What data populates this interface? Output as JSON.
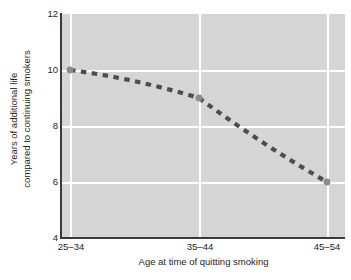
{
  "chart_data": {
    "type": "line",
    "title": "",
    "subtitle": "",
    "xlabel": "Age at time of quitting smoking",
    "ylabel": "Years of additional life compared to continuing smokers",
    "ylabel_line1": "Years of additional life",
    "ylabel_line2": "compared to continuing smokers",
    "categories": [
      "25–34",
      "35–44",
      "45–54"
    ],
    "values": [
      10,
      9,
      6
    ],
    "series": [
      {
        "name": "Years of additional life",
        "values": [
          10,
          9,
          6
        ]
      }
    ],
    "xticklabels": [
      "25–34",
      "35–44",
      "45–54"
    ],
    "yticklabels": [
      "4",
      "6",
      "8",
      "10",
      "12"
    ],
    "ytickvalues": [
      4,
      6,
      8,
      10,
      12
    ],
    "ylim": [
      4,
      12
    ],
    "grid": "white gridlines on gray panel",
    "grid_x": true,
    "grid_y": true,
    "legend": "none",
    "legend_position": "none",
    "line_style": "dashed",
    "marker": "circle",
    "colors": {
      "panel_background": "#d5d5d5",
      "gridline": "#ffffff",
      "axis_line": "#3a3a3a",
      "line": "#4d4d4d",
      "marker": "#8c8c8c",
      "text": "#231f20",
      "page_background": "#ffffff"
    }
  },
  "axes": {
    "y_ticks": [
      {
        "label": "12",
        "value": 12
      },
      {
        "label": "10",
        "value": 10
      },
      {
        "label": "8",
        "value": 8
      },
      {
        "label": "6",
        "value": 6
      },
      {
        "label": "4",
        "value": 4
      }
    ],
    "x_ticks": [
      {
        "label": "25–34"
      },
      {
        "label": "35–44"
      },
      {
        "label": "45–54"
      }
    ]
  }
}
